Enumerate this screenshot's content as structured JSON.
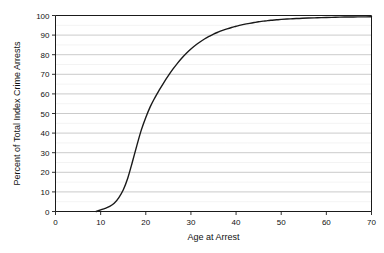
{
  "chart_data": {
    "type": "line",
    "title": "",
    "xlabel": "Age at Arrest",
    "ylabel": "Percent of Total Index Crime Arrests",
    "xlim": [
      0,
      70
    ],
    "ylim": [
      0,
      100
    ],
    "xticks": [
      0,
      10,
      20,
      30,
      40,
      50,
      60,
      70
    ],
    "yticks": [
      0,
      10,
      20,
      30,
      40,
      50,
      60,
      70,
      80,
      90,
      100
    ],
    "xtick_labels": [
      "0",
      "10",
      "20",
      "30",
      "40",
      "50",
      "60",
      "70"
    ],
    "ytick_labels": [
      "0",
      "10",
      "20",
      "30",
      "40",
      "50",
      "60",
      "70",
      "80",
      "90",
      "100"
    ],
    "grid": true,
    "grid_axis": "y",
    "minor_grid": true,
    "legend": "none",
    "line_color": "#1a1a1a",
    "line_width": 1.4,
    "series": [
      {
        "name": "Cumulative percent of total index crime arrests",
        "x": [
          9,
          10,
          11,
          12,
          13,
          14,
          15,
          16,
          17,
          18,
          19,
          20,
          21,
          22,
          23,
          24,
          25,
          26,
          27,
          28,
          29,
          30,
          31,
          32,
          33,
          34,
          35,
          36,
          37,
          38,
          39,
          40,
          41,
          42,
          43,
          44,
          45,
          46,
          47,
          48,
          49,
          50,
          52,
          54,
          56,
          58,
          60,
          62,
          64,
          66,
          68,
          70
        ],
        "values": [
          0,
          0.8,
          1.6,
          2.6,
          4.2,
          7.0,
          11.0,
          17.0,
          25.0,
          33.5,
          41.5,
          48.0,
          53.5,
          58.0,
          62.0,
          65.8,
          69.3,
          72.6,
          75.6,
          78.3,
          80.7,
          82.9,
          84.8,
          86.5,
          88.0,
          89.3,
          90.5,
          91.5,
          92.4,
          93.2,
          93.9,
          94.5,
          95.1,
          95.6,
          96.0,
          96.4,
          96.8,
          97.1,
          97.4,
          97.6,
          97.8,
          98.0,
          98.3,
          98.5,
          98.7,
          98.85,
          99.0,
          99.1,
          99.2,
          99.25,
          99.3,
          99.35
        ]
      }
    ]
  },
  "axes": {
    "x_title": "Age at Arrest",
    "y_title": "Percent of Total Index Crime Arrests"
  }
}
